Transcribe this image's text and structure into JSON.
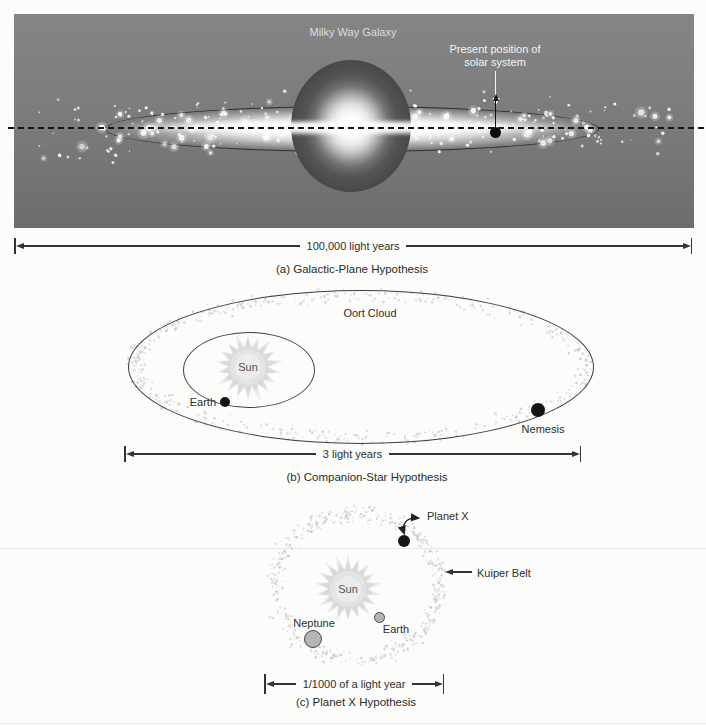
{
  "panel_a": {
    "title": "Milky Way Galaxy",
    "annotation_line1": "Present position of",
    "annotation_line2": "solar system",
    "scale_label": "100,000 light years",
    "caption": "(a) Galactic-Plane Hypothesis"
  },
  "panel_b": {
    "oort_label": "Oort Cloud",
    "sun_label": "Sun",
    "earth_label": "Earth",
    "nemesis_label": "Nemesis",
    "scale_label": "3 light years",
    "caption": "(b) Companion-Star Hypothesis"
  },
  "panel_c": {
    "planet_x_label": "Planet X",
    "kuiper_label": "Kuiper Belt",
    "sun_label": "Sun",
    "neptune_label": "Neptune",
    "earth_label": "Earth",
    "scale_label": "1/1000 of a light year",
    "caption": "(c) Planet X Hypothesis"
  },
  "colors": {
    "galaxy_background": "#7b7b7b",
    "page_background": "#fcfcfa",
    "ink": "#2e2e2e",
    "star_white": "#ffffff",
    "stipple_gray": "#c6c6c6",
    "sunburst_gray": "#d8d8d8"
  }
}
